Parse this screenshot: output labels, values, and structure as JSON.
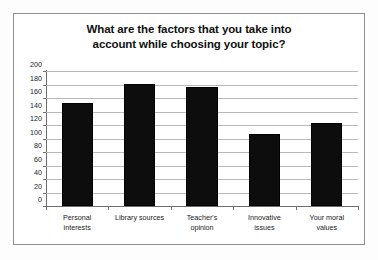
{
  "chart_data": {
    "type": "bar",
    "title": "What are the factors that you take into account while choosing your topic?",
    "title_line1": "What are the factors that you take into",
    "title_line2": "account while choosing your topic?",
    "categories": [
      "Personal interests",
      "Library sources",
      "Teacher's opinion",
      "Innovative issues",
      "Your moral values"
    ],
    "category_lines": [
      [
        "Personal",
        "interests"
      ],
      [
        "Library sources",
        ""
      ],
      [
        "Teacher's",
        "opinion"
      ],
      [
        "Innovative",
        "issues"
      ],
      [
        "Your moral",
        "values"
      ]
    ],
    "values": [
      153,
      181,
      176,
      107,
      123
    ],
    "xlabel": "",
    "ylabel": "",
    "ylim": [
      0,
      200
    ],
    "ytick_step": 20,
    "yticks": [
      200,
      180,
      160,
      140,
      120,
      100,
      80,
      60,
      40,
      20,
      0
    ],
    "ytick_labels": [
      "200",
      "180",
      "160",
      "140",
      "120",
      "100",
      "80",
      "60",
      "40",
      "20",
      "0"
    ],
    "grid": true,
    "legend": false,
    "bar_color": "#0d0d0d",
    "gridline_color": "#b9b9b9",
    "axis_color": "#6d6d6d",
    "plot_background": "#ffffff",
    "frame_border_color": "#8f8f8f"
  }
}
